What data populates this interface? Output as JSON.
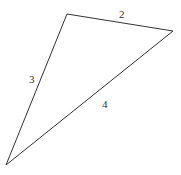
{
  "diagram": {
    "type": "triangle",
    "vertices": {
      "A": {
        "x": 67,
        "y": 14
      },
      "B": {
        "x": 173,
        "y": 31
      },
      "C": {
        "x": 6,
        "y": 165
      }
    },
    "edges": [
      {
        "from": "A",
        "to": "B",
        "label": "2",
        "label_x": 119,
        "label_y": 18
      },
      {
        "from": "A",
        "to": "C",
        "label": "3",
        "label_x": 29,
        "label_y": 83
      },
      {
        "from": "B",
        "to": "C",
        "label": "4",
        "label_x": 102,
        "label_y": 108
      }
    ],
    "line_color": "#333333",
    "background": "#ffffff"
  }
}
